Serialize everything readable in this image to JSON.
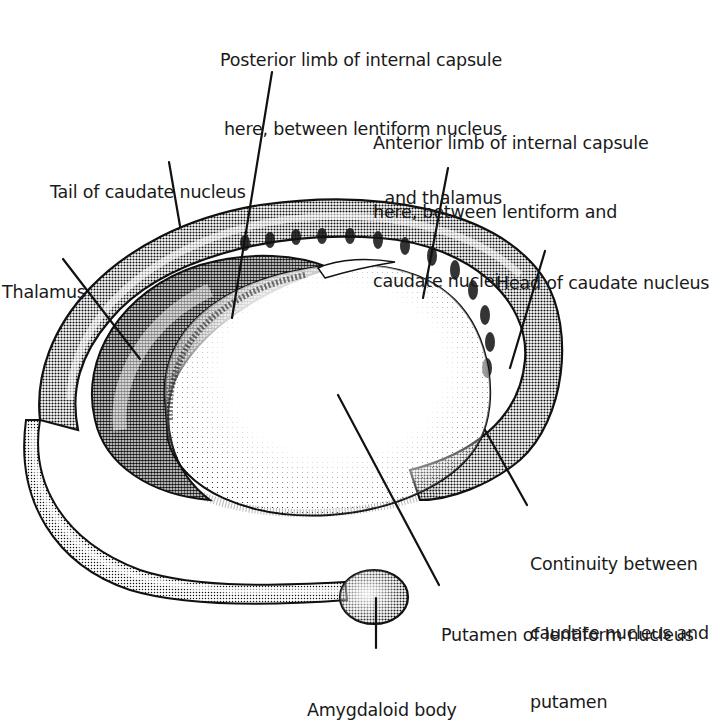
{
  "diagram": {
    "style": {
      "ink": "#111111",
      "paper": "#ffffff"
    },
    "labels": [
      {
        "id": "posterior-limb",
        "lines": [
          "Posterior limb of internal capsule",
          "here, between lentiform nucleus",
          "and thalamus"
        ],
        "align": "right",
        "x": 142,
        "y": 3,
        "w": 360,
        "leader": {
          "x1": 272,
          "y1": 72,
          "x2": 232,
          "y2": 318
        }
      },
      {
        "id": "anterior-limb",
        "lines": [
          "Anterior limb of internal capsule",
          "here, between lentiform and",
          "caudate nuclei"
        ],
        "align": "left",
        "x": 373,
        "y": 86,
        "w": 330,
        "leader": {
          "x1": 448,
          "y1": 168,
          "x2": 423,
          "y2": 298
        }
      },
      {
        "id": "tail-caudate",
        "lines": [
          "Tail of caudate nucleus"
        ],
        "align": "left",
        "x": 50,
        "y": 135,
        "w": 230,
        "leader": {
          "x1": 169,
          "y1": 162,
          "x2": 180,
          "y2": 226
        }
      },
      {
        "id": "head-caudate",
        "lines": [
          "Head of caudate nucleus"
        ],
        "align": "left",
        "x": 496,
        "y": 226,
        "w": 226,
        "leader": {
          "x1": 545,
          "y1": 251,
          "x2": 510,
          "y2": 368
        }
      },
      {
        "id": "thalamus",
        "lines": [
          "Thalamus"
        ],
        "align": "left",
        "x": 2,
        "y": 235,
        "w": 100,
        "leader": {
          "x1": 63,
          "y1": 259,
          "x2": 140,
          "y2": 359
        }
      },
      {
        "id": "continuity",
        "lines": [
          "Continuity between",
          "caudate nucleus and",
          "putamen"
        ],
        "align": "left",
        "x": 530,
        "y": 507,
        "w": 192,
        "leader": {
          "x1": 527,
          "y1": 505,
          "x2": 485,
          "y2": 430
        }
      },
      {
        "id": "putamen",
        "lines": [
          "Putamen of lentiform nucleus"
        ],
        "align": "left",
        "x": 441,
        "y": 578,
        "w": 281,
        "leader": {
          "x1": 439,
          "y1": 585,
          "x2": 338,
          "y2": 395
        }
      },
      {
        "id": "amygdaloid",
        "lines": [
          "Amygdaloid body"
        ],
        "align": "left",
        "x": 307,
        "y": 653,
        "w": 200,
        "leader": {
          "x1": 376,
          "y1": 648,
          "x2": 376,
          "y2": 598
        }
      }
    ]
  }
}
